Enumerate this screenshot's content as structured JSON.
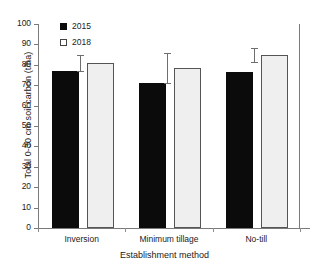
{
  "chart_data": {
    "type": "bar",
    "title": "",
    "xlabel": "Establishment method",
    "ylabel": "Total 0-30 cm soil carbon (t/ha)",
    "categories": [
      "Inversion",
      "Minimum tillage",
      "No-till"
    ],
    "series": [
      {
        "name": "2015",
        "color": "#0b0b0b",
        "values": [
          77.0,
          71.3,
          76.5
        ],
        "errors": [
          null,
          null,
          null
        ]
      },
      {
        "name": "2018",
        "color": "#efefef",
        "values": [
          81.0,
          78.5,
          84.8
        ],
        "errors": [
          4.0,
          7.3,
          3.3
        ]
      }
    ],
    "ylim": [
      0,
      100
    ],
    "yticks": [
      0,
      10,
      20,
      30,
      40,
      50,
      60,
      70,
      80,
      90,
      100
    ],
    "ytick_labels": [
      "0",
      "10",
      "20",
      "30",
      "40",
      "50",
      "60",
      "70",
      "80",
      "90",
      "100"
    ],
    "grid": false,
    "legend_position": "top-left",
    "error_bar_style": "capped-vertical-left-of-bar"
  },
  "legend": {
    "items": [
      {
        "label": "2015",
        "swatch": "filled-black-square"
      },
      {
        "label": "2018",
        "swatch": "open-white-square"
      }
    ]
  },
  "axes": {
    "y_title": "Total 0-30 cm soil carbon (t/ha)",
    "x_title": "Establishment method"
  }
}
